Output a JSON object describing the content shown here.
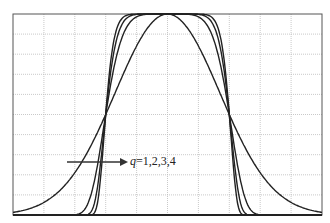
{
  "chart_data": {
    "type": "line",
    "title": "",
    "xlabel": "",
    "ylabel": "",
    "xlim": [
      -5,
      5
    ],
    "ylim": [
      0,
      1
    ],
    "grid": true,
    "grid_divisions": {
      "x": 10,
      "y": 10
    },
    "legend": null,
    "annotation": {
      "text_var": "q",
      "text_values": "=1,2,3,4",
      "arrow": "right",
      "position": "lower-left-center"
    },
    "series": [
      {
        "name": "q=1",
        "description": "widest bell-shaped curve, tails extend to plot edges"
      },
      {
        "name": "q=2",
        "description": "flatter top, steeper sides"
      },
      {
        "name": "q=3",
        "description": "flatter top, steeper sides"
      },
      {
        "name": "q=4",
        "description": "flattest top, steepest sides"
      }
    ]
  },
  "annotation": {
    "var": "q",
    "values": "=1,2,3,4"
  },
  "colors": {
    "curve": "#222222",
    "grid": "#bbbbbb",
    "frame": "#555555"
  }
}
